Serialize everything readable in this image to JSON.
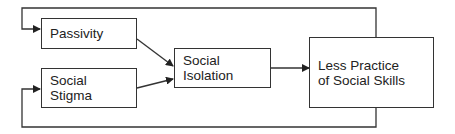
{
  "diagram": {
    "nodes": [
      {
        "id": "passivity",
        "label": "Passivity"
      },
      {
        "id": "social-stigma",
        "label": "Social\nStigma"
      },
      {
        "id": "social-isolation",
        "label": "Social\nIsolation"
      },
      {
        "id": "less-practice",
        "label": "Less Practice\nof Social Skills"
      }
    ],
    "edges": [
      {
        "from": "passivity",
        "to": "social-isolation"
      },
      {
        "from": "social-stigma",
        "to": "social-isolation"
      },
      {
        "from": "social-isolation",
        "to": "less-practice"
      },
      {
        "from": "less-practice",
        "to": "passivity",
        "type": "feedback-loop-top"
      },
      {
        "from": "less-practice",
        "to": "social-stigma",
        "type": "feedback-loop-bottom"
      }
    ]
  }
}
